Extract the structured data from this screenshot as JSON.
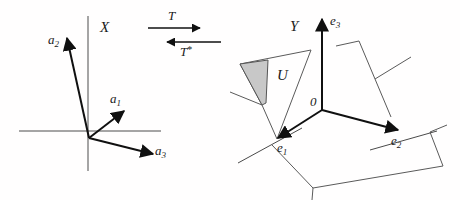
{
  "figure": {
    "background_color": "#fffefe",
    "ink_color": "#101010",
    "shade_color": "#c8c8c8",
    "width": 460,
    "height": 200
  },
  "left_panel": {
    "space_label": "X",
    "vectors": [
      {
        "name": "a1",
        "base": "a",
        "subscript": "1",
        "label": "a₁"
      },
      {
        "name": "a2",
        "base": "a",
        "subscript": "2",
        "label": "a₂"
      },
      {
        "name": "a3",
        "base": "a",
        "subscript": "3",
        "label": "a₃"
      }
    ],
    "axes": {
      "horizontal": "x-axis",
      "vertical": "y-axis"
    }
  },
  "middle_panel": {
    "forward_map_label": "T",
    "adjoint_map_label": "T",
    "adjoint_star": "*",
    "forward_direction": "right",
    "adjoint_direction": "left"
  },
  "right_panel": {
    "space_label": "Y",
    "origin_label": "0",
    "subspace_label": "U",
    "basis_vectors": [
      {
        "name": "e1",
        "base": "e",
        "subscript": "1",
        "label": "e₁"
      },
      {
        "name": "e2",
        "base": "e",
        "subscript": "2",
        "label": "e₂"
      },
      {
        "name": "e3",
        "base": "e",
        "subscript": "3",
        "label": "e₃"
      }
    ],
    "planes": [
      {
        "name": "horizontal-plane",
        "shaded": false
      },
      {
        "name": "u-plane",
        "shaded": true
      },
      {
        "name": "right-plane",
        "shaded": false
      }
    ]
  }
}
